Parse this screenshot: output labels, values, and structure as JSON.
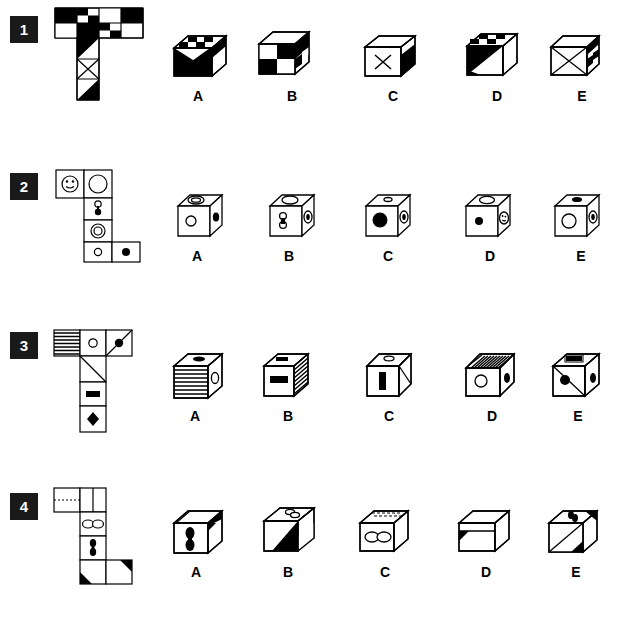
{
  "page": {
    "width": 621,
    "height": 643,
    "background": "#ffffff",
    "ink": "#000000",
    "badge_background": "#1a1a1a",
    "badge_text_color": "#ffffff"
  },
  "option_labels": [
    "A",
    "B",
    "C",
    "D",
    "E"
  ],
  "questions": [
    {
      "number": "1",
      "badge_label": "1",
      "net_shape": "T-shaped net",
      "net_description": "4x2 checkerboard block on top with a vertical 1x3 column descending from the second column: black/white triangle, X-cross square, black/white triangle",
      "net_faces": [
        {
          "id": "q1-top-row-checker",
          "pattern": "checkerboard",
          "cells": "4 wide x 2 tall"
        },
        {
          "id": "q1-col-1",
          "pattern": "diagonal-half-black"
        },
        {
          "id": "q1-col-2",
          "pattern": "x-cross"
        },
        {
          "id": "q1-col-3",
          "pattern": "diagonal-half-black"
        }
      ],
      "options": [
        {
          "label": "A",
          "description": "cube with checker top strip and large black diagonal front face"
        },
        {
          "label": "B",
          "description": "cube with checkerboard front and right faces, white top"
        },
        {
          "label": "C",
          "description": "cube with X-cross on white front, black right face, white top"
        },
        {
          "label": "D",
          "description": "cube with checker top, black diagonal front, white right"
        },
        {
          "label": "E",
          "description": "cube with X-cross front, checkerboard right face, white top"
        }
      ]
    },
    {
      "number": "2",
      "badge_label": "2",
      "net_shape": "zig-zag net",
      "net_description": "smiley face and big circle on top row; below: double-dot domino, concentric rings circle, then small circle and filled black dot",
      "net_faces": [
        {
          "id": "q2-smiley",
          "pattern": "smiley-face"
        },
        {
          "id": "q2-big-circle",
          "pattern": "outline-circle"
        },
        {
          "id": "q2-domino",
          "pattern": "two-dots-one-white-one-black"
        },
        {
          "id": "q2-rings",
          "pattern": "concentric-circles"
        },
        {
          "id": "q2-small-circle",
          "pattern": "small-outline-circle"
        },
        {
          "id": "q2-black-dot",
          "pattern": "filled-black-dot"
        }
      ],
      "options": [
        {
          "label": "A",
          "description": "concentric rings on top, white circle front, black dot right"
        },
        {
          "label": "B",
          "description": "outline ellipse top, domino dots front, concentric rings right"
        },
        {
          "label": "C",
          "description": "small ellipse top, large black dot front, concentric rings right"
        },
        {
          "label": "D",
          "description": "outline ellipse top, small black dot front, smiley right"
        },
        {
          "label": "E",
          "description": "black dot top, large white circle front, concentric rings right"
        }
      ]
    },
    {
      "number": "3",
      "badge_label": "3",
      "net_shape": "T-shaped net",
      "net_description": "horizontal stripes square, small circle square, black dot with diagonal line; column below: diagonal line, black bar, black diamond",
      "net_faces": [
        {
          "id": "q3-stripes",
          "pattern": "horizontal-stripes"
        },
        {
          "id": "q3-circle",
          "pattern": "small-outline-circle"
        },
        {
          "id": "q3-dot-diagonal",
          "pattern": "black-dot-with-diagonal"
        },
        {
          "id": "q3-diagonal",
          "pattern": "diagonal-line"
        },
        {
          "id": "q3-bar",
          "pattern": "black-bar"
        },
        {
          "id": "q3-diamond",
          "pattern": "black-diamond"
        }
      ],
      "options": [
        {
          "label": "A",
          "description": "black bar on top, horizontal stripes front, outline circle right"
        },
        {
          "label": "B",
          "description": "black bar top, black bar on white front, striped right face"
        },
        {
          "label": "C",
          "description": "small ellipse top, vertical black bar front, diagonal right face"
        },
        {
          "label": "D",
          "description": "striped top, white circle front, black dot right"
        },
        {
          "label": "E",
          "description": "black bar in frame top, black dot with diagonal front, black dot right"
        }
      ]
    },
    {
      "number": "4",
      "badge_label": "4",
      "net_shape": "zig-zag net",
      "net_description": "top row blank and split square; below: double ellipse, vertical double dots, and black corner triangle square",
      "net_faces": [
        {
          "id": "q4-blank",
          "pattern": "blank-dashed"
        },
        {
          "id": "q4-split",
          "pattern": "vertical-split"
        },
        {
          "id": "q4-double-ellipse",
          "pattern": "two-joined-ellipses"
        },
        {
          "id": "q4-double-dot",
          "pattern": "vertical-double-dot"
        },
        {
          "id": "q4-corner-triangle",
          "pattern": "black-corner-triangle"
        }
      ],
      "options": [
        {
          "label": "A",
          "description": "split top, vertical double dots front, black corner right"
        },
        {
          "label": "B",
          "description": "double ellipse top, white front with black diagonal corner"
        },
        {
          "label": "C",
          "description": "dashed top, joined ellipses front, plain right"
        },
        {
          "label": "D",
          "description": "plain top, black corner triangle at left of front face"
        },
        {
          "label": "E",
          "description": "double dots top, black diagonal corner front and right"
        }
      ]
    }
  ]
}
